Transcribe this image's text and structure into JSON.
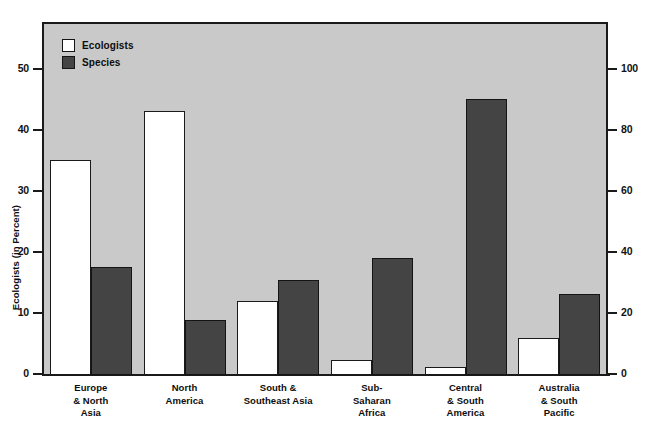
{
  "chart_data": {
    "type": "bar",
    "title": "",
    "categories": [
      "Europe\n& North\nAsia",
      "North\nAmerica",
      "South &\nSoutheast Asia",
      "Sub-\nSaharan\nAfrica",
      "Central\n& South\nAmerica",
      "Australia\n& South\nPacific"
    ],
    "category_lines": [
      [
        "Europe",
        "& North",
        "Asia"
      ],
      [
        "North",
        "America"
      ],
      [
        "South &",
        "Southeast Asia"
      ],
      [
        "Sub-",
        "Saharan",
        "Africa"
      ],
      [
        "Central",
        "& South",
        "America"
      ],
      [
        "Australia",
        "& South",
        "Pacific"
      ]
    ],
    "series": [
      {
        "name": "Ecologists",
        "axis": "left",
        "color": "#ffffff",
        "values": [
          35.2,
          43.3,
          12.1,
          2.4,
          1.3,
          6.1
        ]
      },
      {
        "name": "Species",
        "axis": "right",
        "color": "#444444",
        "values": [
          35.5,
          18.0,
          31.0,
          38.5,
          90.5,
          26.5
        ]
      }
    ],
    "xlabel": "",
    "ylabel": "Ecologists (in Percent)",
    "y2label": "Vascular Plant Species (in Thousands)",
    "ylim": [
      0,
      57.5
    ],
    "y2lim": [
      0,
      115
    ],
    "yticks": [
      0,
      10,
      20,
      30,
      40,
      50
    ],
    "y2ticks": [
      0,
      20,
      40,
      60,
      80,
      100
    ],
    "ytick_labels": [
      "0",
      "10",
      "20",
      "30",
      "40",
      "50"
    ],
    "y2tick_labels": [
      "0",
      "20",
      "40",
      "60",
      "80",
      "100"
    ],
    "grid": false,
    "legend": {
      "position": "top-left",
      "entries": [
        {
          "label": "Ecologists",
          "swatch": "white-square",
          "color": "#ffffff"
        },
        {
          "label": "Species",
          "swatch": "dark-square",
          "color": "#444444"
        }
      ]
    },
    "plot_background": "#c9c9c9",
    "axis_color": "#1a1a1a"
  }
}
